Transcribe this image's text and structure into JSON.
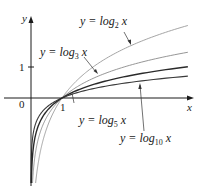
{
  "chart_data": {
    "type": "line",
    "title": "",
    "xlabel": "x",
    "ylabel": "y",
    "origin_label": "0",
    "x_ticks": [
      {
        "value": 1,
        "label": "1"
      }
    ],
    "y_ticks": [
      {
        "value": 1,
        "label": "1"
      }
    ],
    "xlim": [
      -0.1,
      5.2
    ],
    "ylim": [
      -2.7,
      2.6
    ],
    "grid": false,
    "legend": "none (inline annotations with leader lines)",
    "series": [
      {
        "name": "y = log2 x",
        "base": 2,
        "color": "#9a9a9a",
        "stroke_width": 0.9,
        "x": [
          0.06,
          0.1,
          0.25,
          0.5,
          1,
          2,
          3,
          4,
          5.06
        ],
        "y": [
          -4.06,
          -3.32,
          -2.0,
          -1.0,
          0,
          1.0,
          1.58,
          2.0,
          2.34
        ]
      },
      {
        "name": "y = log3 x",
        "base": 3,
        "color": "#8a8a8a",
        "stroke_width": 0.9,
        "x": [
          0.06,
          0.1,
          0.25,
          0.5,
          1,
          2,
          3,
          4,
          5.06
        ],
        "y": [
          -2.56,
          -2.1,
          -1.26,
          -0.63,
          0,
          0.63,
          1.0,
          1.26,
          1.47
        ]
      },
      {
        "name": "y = log5 x",
        "base": 5,
        "color": "#2a2a2a",
        "stroke_width": 1.4,
        "x": [
          0.06,
          0.1,
          0.25,
          0.5,
          1,
          2,
          3,
          4,
          5.06
        ],
        "y": [
          -1.75,
          -1.43,
          -0.86,
          -0.43,
          0,
          0.43,
          0.68,
          0.86,
          1.0
        ]
      },
      {
        "name": "y = log10 x",
        "base": 10,
        "color": "#3a3a3a",
        "stroke_width": 1.1,
        "x": [
          0.06,
          0.1,
          0.25,
          0.5,
          1,
          2,
          3,
          4,
          5.06
        ],
        "y": [
          -1.22,
          -1.0,
          -0.6,
          -0.3,
          0,
          0.3,
          0.48,
          0.6,
          0.7
        ]
      }
    ],
    "annotations": [
      {
        "text": "y = log2 x",
        "base_label": "log",
        "sub": "2",
        "points_to": "log2 curve near x≈3"
      },
      {
        "text": "y = log3 x",
        "base_label": "log",
        "sub": "3",
        "points_to": "log3 curve near x≈1.9"
      },
      {
        "text": "y = log5 x",
        "base_label": "log",
        "sub": "5",
        "points_to": "log5 curve near x≈1.3"
      },
      {
        "text": "y = log10 x",
        "base_label": "log",
        "sub": "10",
        "points_to": "log10 curve near x≈3"
      }
    ]
  },
  "labels": {
    "y_axis": "y",
    "x_axis": "x",
    "origin": "0",
    "x_tick_1": "1",
    "y_tick_1": "1",
    "log2": {
      "prefix": "y = log",
      "sub": "2",
      "var": "x"
    },
    "log3": {
      "prefix": "y = log",
      "sub": "3",
      "var": "x"
    },
    "log5": {
      "prefix": "y = log",
      "sub": "5",
      "var": "x"
    },
    "log10": {
      "prefix": "y = log",
      "sub": "10",
      "var": "x"
    }
  },
  "colors": {
    "axis": "#1a1a1a",
    "log2": "#9a9a9a",
    "log3": "#8a8a8a",
    "log5": "#2a2a2a",
    "log10": "#3a3a3a",
    "leader": "#333333"
  }
}
